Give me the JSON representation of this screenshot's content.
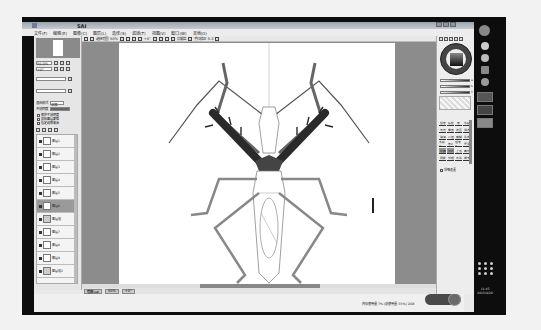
{
  "window": {
    "title": "SAI",
    "app": "PaintTool SAI"
  },
  "menubar": {
    "items": [
      {
        "label": "文件(F)"
      },
      {
        "label": "编辑(E)"
      },
      {
        "label": "图像(C)"
      },
      {
        "label": "图层(L)"
      },
      {
        "label": "选择(S)"
      },
      {
        "label": "滤镜(T)"
      },
      {
        "label": "视图(V)"
      },
      {
        "label": "窗口(W)"
      },
      {
        "label": "其他(O)"
      }
    ]
  },
  "toolbar": {
    "selection_label": "选择范围",
    "zoom_value": "50%",
    "rotation_value": "+0°",
    "stabilizer_label": "手抖修正",
    "stabilizer_value": "S-3",
    "antialias_label": "抗锯齿"
  },
  "left_panel": {
    "navigator_zoom": "50.0%",
    "rotation": "+0°",
    "layer_mode_label": "混合模式",
    "layer_mode_value": "正常",
    "opacity_label": "不透明度",
    "opacity_value": "100%",
    "options": [
      "保护不透明度",
      "剪贴图层蒙版",
      "指定选取来源"
    ],
    "layers": [
      {
        "name": "图层1",
        "selected": false
      },
      {
        "name": "图层2",
        "selected": false
      },
      {
        "name": "图层3",
        "selected": false
      },
      {
        "name": "图层4",
        "selected": false
      },
      {
        "name": "图层5",
        "selected": false
      },
      {
        "name": "图层6",
        "selected": true
      },
      {
        "name": "图层组",
        "selected": false
      },
      {
        "name": "图层7",
        "selected": false
      },
      {
        "name": "图层8",
        "selected": false
      },
      {
        "name": "图层9",
        "selected": false
      },
      {
        "name": "图层组2",
        "selected": false
      },
      {
        "name": "图层10",
        "selected": false
      },
      {
        "name": "图层11",
        "selected": false
      },
      {
        "name": "背景",
        "selected": false
      }
    ]
  },
  "right_panel": {
    "sliders": [
      {
        "label": "H"
      },
      {
        "label": "S"
      },
      {
        "label": "V"
      }
    ],
    "tools": [
      {
        "label": "铅笔"
      },
      {
        "label": "喷枪"
      },
      {
        "label": "笔"
      },
      {
        "label": "水彩"
      },
      {
        "label": "马克"
      },
      {
        "label": "橡皮"
      },
      {
        "label": "选区"
      },
      {
        "label": "消选"
      },
      {
        "label": "油漆"
      },
      {
        "label": "二值"
      },
      {
        "label": "模糊"
      },
      {
        "label": "涂抹"
      },
      {
        "label": "水彩2"
      },
      {
        "label": "笔2"
      },
      {
        "label": "铅笔2"
      },
      {
        "label": "厚涂"
      },
      {
        "label": "线稿"
      },
      {
        "label": "勾线"
      },
      {
        "label": "上色"
      },
      {
        "label": "高光"
      },
      {
        "label": "阴影"
      },
      {
        "label": "纹理"
      },
      {
        "label": "平涂"
      },
      {
        "label": "细节"
      }
    ],
    "option_label": "详细设置"
  },
  "statusbar": {
    "file_name": "螳螂.sai",
    "zoom": "50%",
    "angle": "+0°",
    "memory_info": "内存使用量 7%  (总使用量 35%)  2GB"
  },
  "taskbar": {
    "time": "11:45",
    "date": "2015/4/20"
  },
  "colors": {
    "workspace_bg": "#8c8c8c",
    "panel_bg": "#e8e8e8",
    "canvas": "#ffffff",
    "insect_dark": "#2a2a2a",
    "insect_mid": "#8a8a8a"
  }
}
